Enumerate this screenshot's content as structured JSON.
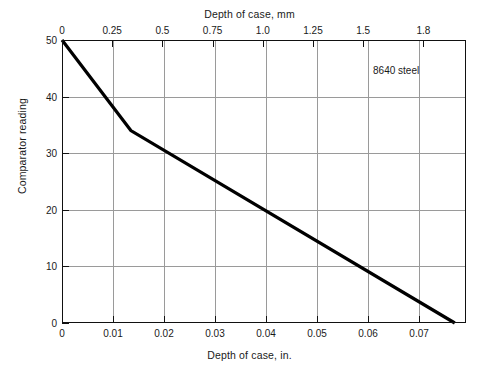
{
  "figure": {
    "top_axis_title": "Depth of case, mm",
    "bottom_axis_title": "Depth of case, in.",
    "y_axis_title": "Comparator reading",
    "annotation": "8640 steel"
  },
  "chart_data": {
    "type": "line",
    "title": "",
    "subtitle": "",
    "xlabel": "Depth of case, in.",
    "ylabel": "Comparator reading",
    "x2label": "Depth of case, mm",
    "grid": true,
    "legend_position": "none",
    "line_color": "#000000",
    "line_width_px": 3.2,
    "xlim": [
      0,
      0.0792
    ],
    "ylim": [
      0,
      50
    ],
    "x2lim": [
      0,
      2.012
    ],
    "xticks": [
      0,
      0.01,
      0.02,
      0.03,
      0.04,
      0.05,
      0.06,
      0.07
    ],
    "xticklabels": [
      "0",
      "0.01",
      "0.02",
      "0.03",
      "0.04",
      "0.05",
      "0.06",
      "0.07"
    ],
    "x2ticks": [
      0,
      0.25,
      0.5,
      0.75,
      1.0,
      1.25,
      1.5,
      1.8
    ],
    "x2ticklabels": [
      "0",
      "0.25",
      "0.5",
      "0.75",
      "1.0",
      "1.25",
      "1.5",
      "1.8"
    ],
    "yticks": [
      0,
      10,
      20,
      30,
      40,
      50
    ],
    "yticklabels": [
      "0",
      "10",
      "20",
      "30",
      "40",
      "50"
    ],
    "series": [
      {
        "name": "8640 steel",
        "x": [
          0,
          0.0135,
          0.077
        ],
        "y": [
          50,
          34,
          0
        ],
        "x_mm": [
          0,
          0.343,
          1.956
        ],
        "points_note": "piecewise linear; knee at 0.0135 in (0.34 mm), reading 34"
      }
    ],
    "annotations": [
      {
        "text": "8640 steel",
        "x": 0.0655,
        "y": 44.5
      }
    ]
  }
}
